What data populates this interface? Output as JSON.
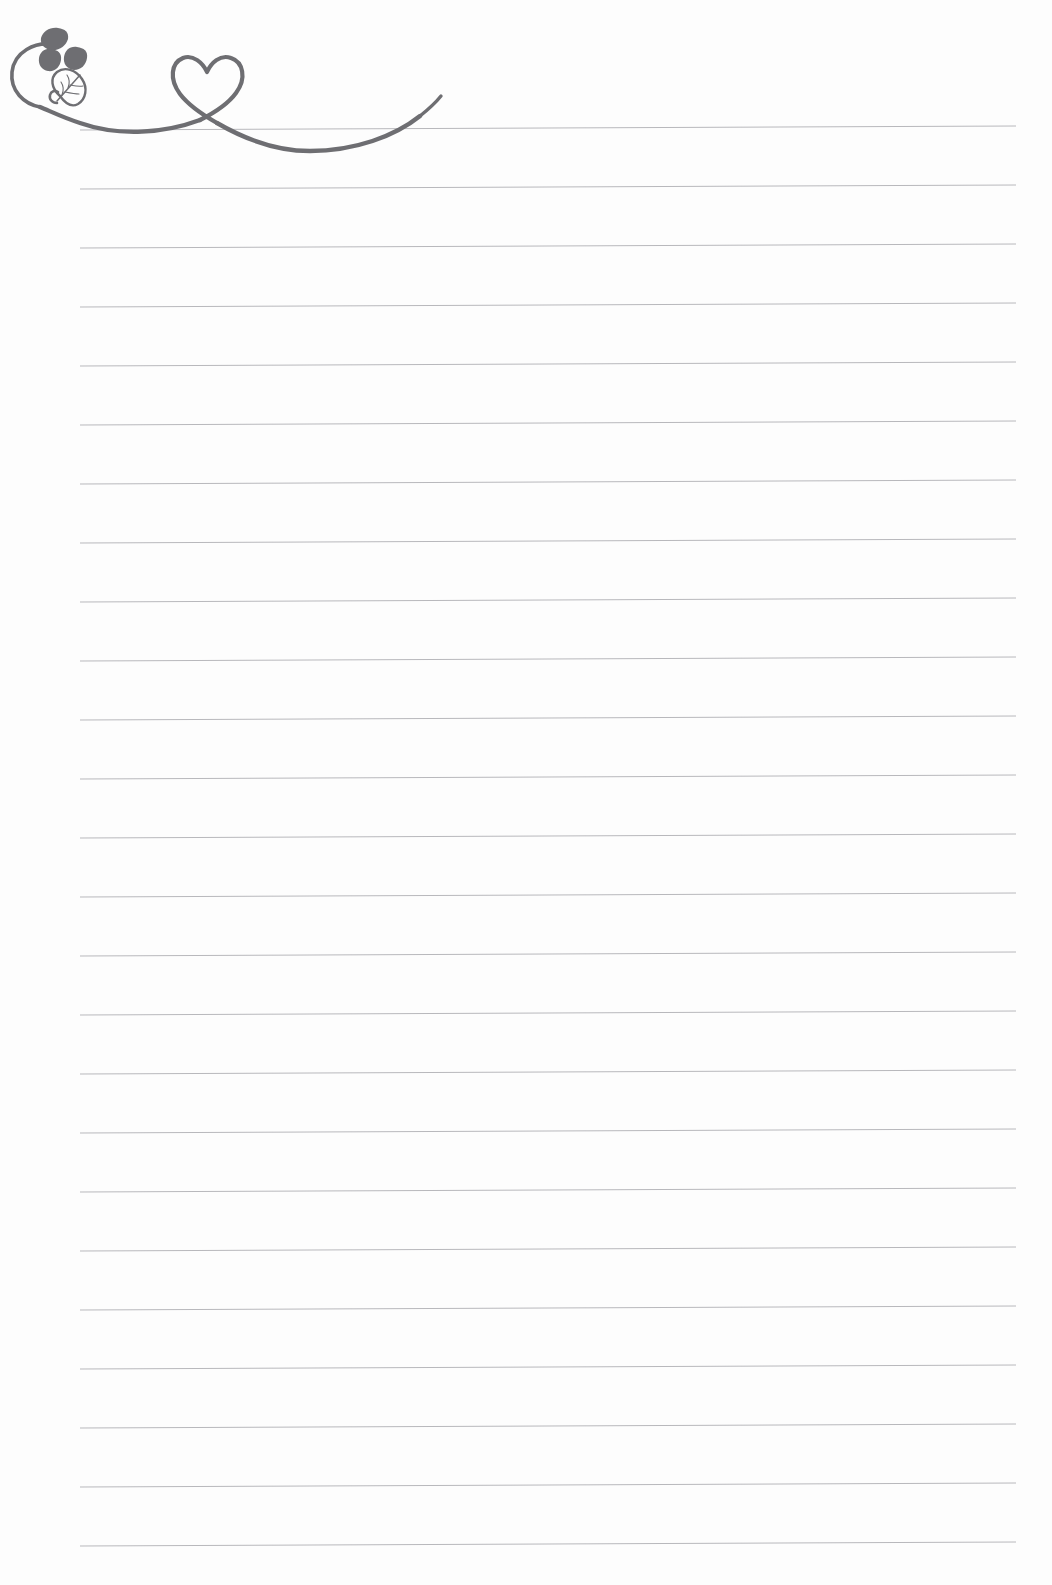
{
  "page": {
    "width": 1052,
    "height": 1585,
    "background_color": "#fdfdfd",
    "type": "blank-ruled-writing-paper"
  },
  "ruled_lines": {
    "name": "ruled-guide-lines",
    "count": 25,
    "color": "#b8b8bc",
    "thickness": 1,
    "first_line_y": 130,
    "spacing": 59,
    "left_x": 80,
    "right_x": 1016,
    "right_rise": 4,
    "y_positions": [
      130,
      189,
      248,
      307,
      366,
      425,
      484,
      543,
      602,
      661,
      720,
      779,
      838,
      897,
      956,
      1015,
      1074,
      1133,
      1192,
      1251,
      1310,
      1369,
      1428,
      1487,
      1546
    ]
  },
  "flourish": {
    "name": "heart-vine-flourish",
    "color": "#6e6e72",
    "stroke_width": 4,
    "description": "Hand-drawn decorative swirl with a heart loop and a leafed spiral at the left end",
    "elements": [
      {
        "name": "spiral-curl",
        "type": "curve"
      },
      {
        "name": "sweeping-curve-left",
        "type": "curve"
      },
      {
        "name": "heart-loop",
        "type": "curve"
      },
      {
        "name": "descending-swoop",
        "type": "curve"
      },
      {
        "name": "upturned-tail",
        "type": "curve"
      }
    ],
    "leaves": [
      {
        "name": "leaf-small-top",
        "style": "solid",
        "color": "#6e6e72"
      },
      {
        "name": "leaf-small-left",
        "style": "solid",
        "color": "#6e6e72"
      },
      {
        "name": "leaf-small-right",
        "style": "solid",
        "color": "#6e6e72"
      },
      {
        "name": "leaf-large-veined",
        "style": "outline",
        "color": "#6e6e72"
      }
    ]
  },
  "writing_area": {
    "name": "writing-area",
    "content": "",
    "placeholder": ""
  }
}
